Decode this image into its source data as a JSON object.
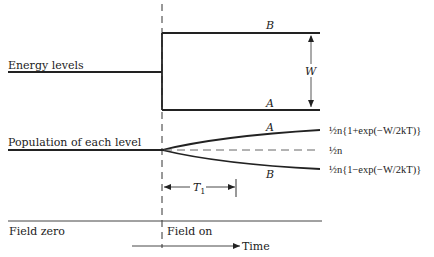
{
  "diagram": {
    "type": "energy-level-population-diagram",
    "labels": {
      "energy_levels": "Energy levels",
      "population": "Population of each level",
      "field_zero": "Field zero",
      "field_on": "Field on",
      "time": "Time"
    },
    "levels": {
      "upper": "B",
      "lower": "A",
      "gap": "W"
    },
    "population_curves": {
      "upper_curve_label": "A",
      "lower_curve_label": "B",
      "upper_value": "½n{1+exp(−W/2kT)}",
      "middle_value": "½n",
      "lower_value": "½n{1−exp(−W/2kT)}"
    },
    "time_constant": {
      "symbol": "T",
      "subscript": "1"
    }
  }
}
